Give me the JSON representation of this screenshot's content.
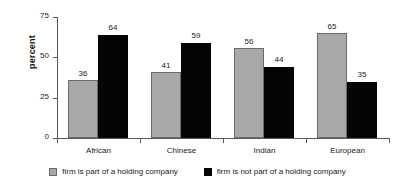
{
  "chart_data": {
    "type": "bar",
    "title": "",
    "xlabel": "",
    "ylabel": "percent",
    "ylim": [
      0,
      75
    ],
    "yticks": [
      0,
      25,
      50,
      75
    ],
    "ytick_labels": [
      "0",
      "25",
      "50",
      "75"
    ],
    "grid": false,
    "legend_position": "bottom-center",
    "categories": [
      "African",
      "Chinese",
      "Indian",
      "European"
    ],
    "series": [
      {
        "name": "firm is part of a holding company",
        "color": "#a8a8a8",
        "values": [
          36,
          41,
          56,
          65
        ],
        "value_labels": [
          "36",
          "41",
          "56",
          "65"
        ]
      },
      {
        "name": "firm is not part of a holding company",
        "color": "#050505",
        "values": [
          64,
          59,
          44,
          35
        ],
        "value_labels": [
          "64",
          "59",
          "44",
          "35"
        ]
      }
    ]
  },
  "axis": {
    "line_color": "#595959"
  }
}
